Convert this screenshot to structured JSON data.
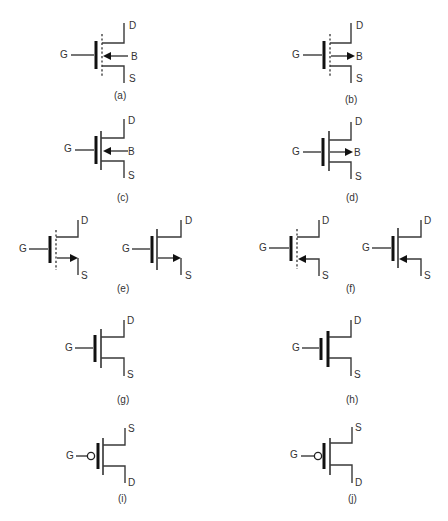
{
  "figure": {
    "terminals": {
      "gate": "G",
      "drain": "D",
      "source": "S",
      "body": "B"
    },
    "symbols": [
      {
        "id": "a",
        "caption": "(a)",
        "channel": "dashed",
        "body_arrow": "in",
        "terminals": [
          "G",
          "D",
          "B",
          "S"
        ]
      },
      {
        "id": "b",
        "caption": "(b)",
        "channel": "dashed",
        "body_arrow": "out",
        "terminals": [
          "G",
          "D",
          "B",
          "S"
        ]
      },
      {
        "id": "c",
        "caption": "(c)",
        "channel": "solid",
        "body_arrow": "in",
        "terminals": [
          "G",
          "D",
          "B",
          "S"
        ]
      },
      {
        "id": "d",
        "caption": "(d)",
        "channel": "solid",
        "body_arrow": "out",
        "terminals": [
          "G",
          "D",
          "B",
          "S"
        ]
      },
      {
        "id": "e",
        "caption": "(e)",
        "variants": [
          "dashed",
          "solid"
        ],
        "source_arrow": "out",
        "terminals": [
          "G",
          "D",
          "S"
        ]
      },
      {
        "id": "f",
        "caption": "(f)",
        "variants": [
          "dashed",
          "solid"
        ],
        "source_arrow": "in",
        "terminals": [
          "G",
          "D",
          "S"
        ]
      },
      {
        "id": "g",
        "caption": "(g)",
        "channel": "solid",
        "terminals": [
          "G",
          "D",
          "S"
        ]
      },
      {
        "id": "h",
        "caption": "(h)",
        "channel": "thick",
        "terminals": [
          "G",
          "D",
          "S"
        ]
      },
      {
        "id": "i",
        "caption": "(i)",
        "gate": "inverted-bubble",
        "terminals": [
          "G",
          "S",
          "D"
        ]
      },
      {
        "id": "j",
        "caption": "(j)",
        "gate": "inverted-bubble",
        "terminals": [
          "G",
          "S",
          "D"
        ]
      }
    ]
  },
  "labels": {
    "G": "G",
    "D": "D",
    "S": "S",
    "B": "B"
  },
  "captions": {
    "a": "(a)",
    "b": "(b)",
    "c": "(c)",
    "d": "(d)",
    "e": "(e)",
    "f": "(f)",
    "g": "(g)",
    "h": "(h)",
    "i": "(i)",
    "j": "(j)"
  },
  "colors": {
    "line": "#3a3a3a",
    "plate": "#111111",
    "background": "#ffffff"
  }
}
